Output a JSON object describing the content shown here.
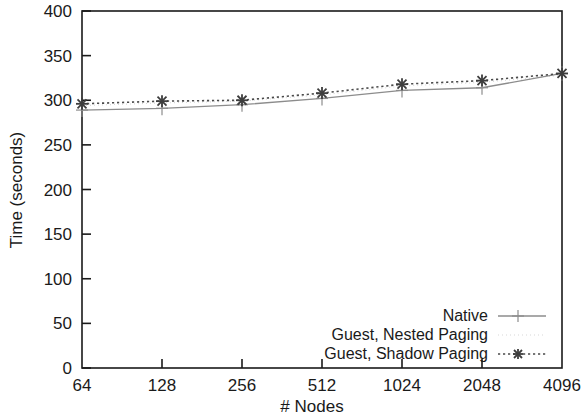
{
  "chart_data": {
    "type": "line",
    "title": "",
    "xlabel": "# Nodes",
    "ylabel": "Time (seconds)",
    "categories": [
      "64",
      "128",
      "256",
      "512",
      "1024",
      "2048",
      "4096"
    ],
    "x_tick_labels": [
      "64",
      "128",
      "256",
      "512",
      "1024",
      "2048",
      "4096"
    ],
    "y_tick_labels": [
      "0",
      "50",
      "100",
      "150",
      "200",
      "250",
      "300",
      "350",
      "400"
    ],
    "y_ticks": [
      0,
      50,
      100,
      150,
      200,
      250,
      300,
      350,
      400
    ],
    "ylim": [
      0,
      400
    ],
    "grid": false,
    "legend_position": "bottom-right",
    "series": [
      {
        "name": "Native",
        "values": [
          289,
          291,
          295,
          302,
          311,
          314,
          330
        ],
        "color": "#8c8c8c",
        "marker": "plus",
        "line_style": "solid"
      },
      {
        "name": "Guest, Nested Paging",
        "values": [
          294,
          297,
          299,
          306,
          316,
          320,
          328
        ],
        "color": "#d8d8d8",
        "marker": "none",
        "line_style": "faint-dotted"
      },
      {
        "name": "Guest, Shadow Paging",
        "values": [
          296,
          299,
          300,
          308,
          318,
          322,
          330
        ],
        "color": "#3d3d3d",
        "marker": "cross",
        "line_style": "dotted"
      }
    ]
  },
  "legend": {
    "entries": [
      {
        "label": "Native"
      },
      {
        "label": "Guest, Nested Paging"
      },
      {
        "label": "Guest, Shadow Paging"
      }
    ]
  },
  "axes": {
    "x_axis_title": "# Nodes",
    "y_axis_title": "Time (seconds)"
  }
}
